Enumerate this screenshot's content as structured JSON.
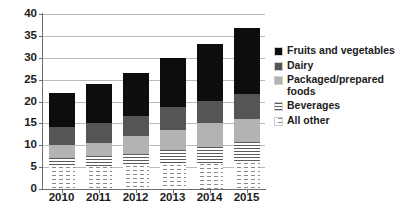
{
  "chart_data": {
    "type": "bar",
    "stacked": true,
    "title": "",
    "subtitle": "",
    "xlabel": "",
    "ylabel": "",
    "categories": [
      "2010",
      "2011",
      "2012",
      "2013",
      "2014",
      "2015"
    ],
    "ylim": [
      0,
      40
    ],
    "ytick_labels": [
      "0",
      "5",
      "10",
      "15",
      "20",
      "25",
      "30",
      "35",
      "40"
    ],
    "ytick_values": [
      0,
      5,
      10,
      15,
      20,
      25,
      30,
      35,
      40
    ],
    "grid": true,
    "legend_position": "right",
    "series": [
      {
        "name": "Fruits and vegetables",
        "color": "#0d0d0d",
        "pattern": "solid",
        "values": [
          7.8,
          9.1,
          9.8,
          11.3,
          12.9,
          15.0
        ]
      },
      {
        "name": "Dairy",
        "color": "#555555",
        "pattern": "solid",
        "values": [
          4.2,
          4.4,
          4.6,
          5.2,
          5.1,
          5.6
        ]
      },
      {
        "name": "Packaged/prepared foods",
        "color": "#b3b3b3",
        "pattern": "solid",
        "values": [
          3.0,
          3.1,
          4.1,
          4.5,
          5.4,
          5.3
        ]
      },
      {
        "name": "Beverages",
        "color": "#5c5c5c",
        "pattern": "horizontal-lines",
        "values": [
          2.0,
          2.4,
          2.7,
          3.5,
          4.0,
          4.8
        ]
      },
      {
        "name": "All other",
        "color": "#8a8a8a",
        "pattern": "dotted",
        "values": [
          5.0,
          5.1,
          5.3,
          5.5,
          5.7,
          6.0
        ]
      }
    ],
    "stack_order_bottom_to_top": [
      "All other",
      "Beverages",
      "Packaged/prepared foods",
      "Dairy",
      "Fruits and vegetables"
    ],
    "cumulative_tops": {
      "2010": [
        5.0,
        7.0,
        10.0,
        14.2,
        22.0
      ],
      "2011": [
        5.1,
        7.5,
        10.6,
        15.0,
        24.1
      ],
      "2012": [
        5.3,
        8.0,
        12.1,
        16.7,
        26.5
      ],
      "2013": [
        5.5,
        9.0,
        13.5,
        18.7,
        30.0
      ],
      "2014": [
        5.7,
        9.7,
        15.1,
        20.2,
        33.1
      ],
      "2015": [
        6.0,
        10.8,
        16.1,
        21.7,
        36.7
      ]
    },
    "totals": [
      22.0,
      24.1,
      26.5,
      30.0,
      33.1,
      36.7
    ]
  },
  "legend": {
    "items": [
      {
        "label": "Fruits and vegetables",
        "swatch": "fill-fruits"
      },
      {
        "label": "Dairy",
        "swatch": "fill-dairy"
      },
      {
        "label": "Packaged/prepared foods",
        "swatch": "fill-packaged"
      },
      {
        "label": "Beverages",
        "swatch": "fill-beverages"
      },
      {
        "label": "All other",
        "swatch": "fill-allother"
      }
    ]
  }
}
